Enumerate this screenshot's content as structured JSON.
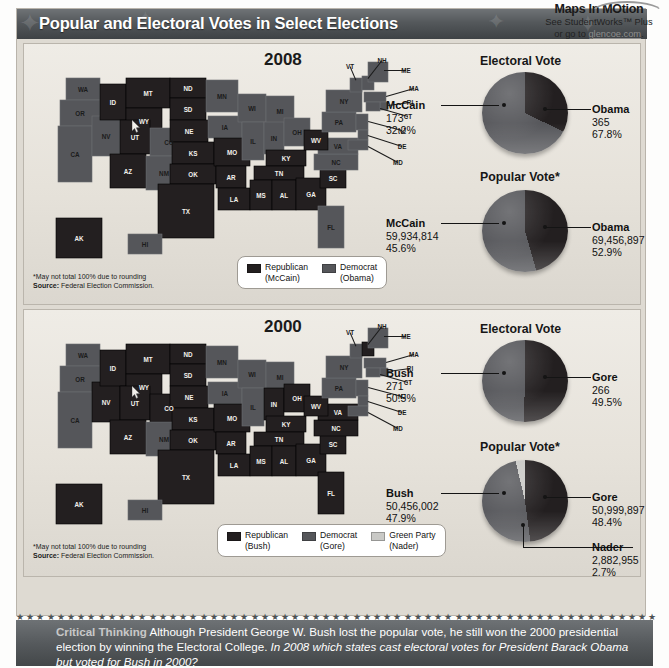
{
  "maps_in_motion": {
    "title": "Maps In MOtion",
    "line1": "See StudentWorks™ Plus",
    "line2_pre": "or go to ",
    "line2_link": "glencoe.com",
    "line2_post": "."
  },
  "banner": {
    "title": "Popular and Electoral Votes in Select Elections"
  },
  "colors": {
    "republican": "#231f20",
    "democrat": "#55565a",
    "green_party": "#c9c9c6",
    "banner": "#54585b",
    "panel_bg": "#e6e2da"
  },
  "sections": [
    {
      "year": "2008",
      "map": {
        "state_labels": [
          "WA",
          "OR",
          "CA",
          "NV",
          "ID",
          "MT",
          "WY",
          "UT",
          "CO",
          "AZ",
          "NM",
          "ND",
          "SD",
          "NE",
          "KS",
          "OK",
          "TX",
          "MN",
          "IA",
          "MO",
          "AR",
          "LA",
          "WI",
          "IL",
          "MI",
          "IN",
          "OH",
          "KY",
          "TN",
          "MS",
          "AL",
          "GA",
          "FL",
          "SC",
          "NC",
          "VA",
          "WV",
          "PA",
          "NY",
          "VT",
          "NH",
          "ME",
          "MA",
          "RI",
          "CT",
          "NJ",
          "DE",
          "MD",
          "AK",
          "HI"
        ],
        "democrat_states": [
          "WA",
          "OR",
          "CA",
          "NV",
          "CO",
          "NM",
          "MN",
          "IA",
          "WI",
          "IL",
          "MI",
          "IN",
          "OH",
          "PA",
          "NY",
          "VT",
          "NH",
          "ME",
          "MA",
          "RI",
          "CT",
          "NJ",
          "DE",
          "MD",
          "VA",
          "NC",
          "FL",
          "HI"
        ],
        "republican_states": [
          "ID",
          "MT",
          "WY",
          "UT",
          "AZ",
          "ND",
          "SD",
          "NE",
          "KS",
          "OK",
          "TX",
          "MO",
          "AR",
          "LA",
          "KY",
          "TN",
          "MS",
          "AL",
          "GA",
          "SC",
          "WV",
          "AK"
        ]
      },
      "legend": [
        {
          "label": "Republican",
          "sub": "(McCain)",
          "color": "#231f20"
        },
        {
          "label": "Democrat",
          "sub": "(Obama)",
          "color": "#55565a"
        }
      ],
      "footnote_star": "*May not total 100% due to rounding",
      "footnote_source_label": "Source:",
      "footnote_source_value": " Federal Election Commission.",
      "charts": [
        {
          "title": "Electoral Vote",
          "title_star": false,
          "slices": [
            {
              "name": "McCain",
              "value": "173",
              "percent": "32.2%",
              "pct": 32.2,
              "color": "#231f20",
              "side": "left"
            },
            {
              "name": "Obama",
              "value": "365",
              "percent": "67.8%",
              "pct": 67.8,
              "color": "#55565a",
              "side": "right"
            }
          ]
        },
        {
          "title": "Popular Vote",
          "title_star": true,
          "slices": [
            {
              "name": "McCain",
              "value": "59,934,814",
              "percent": "45.6%",
              "pct": 45.6,
              "color": "#231f20",
              "side": "left"
            },
            {
              "name": "Obama",
              "value": "69,456,897",
              "percent": "52.9%",
              "pct": 52.9,
              "color": "#55565a",
              "side": "right"
            }
          ]
        }
      ]
    },
    {
      "year": "2000",
      "map": {
        "state_labels": [
          "WA",
          "OR",
          "CA",
          "NV",
          "ID",
          "MT",
          "WY",
          "UT",
          "CO",
          "AZ",
          "NM",
          "ND",
          "SD",
          "NE",
          "KS",
          "OK",
          "TX",
          "MN",
          "IA",
          "MO",
          "AR",
          "LA",
          "WI",
          "IL",
          "MI",
          "IN",
          "OH",
          "KY",
          "TN",
          "MS",
          "AL",
          "GA",
          "FL",
          "SC",
          "NC",
          "VA",
          "WV",
          "PA",
          "NY",
          "VT",
          "NH",
          "ME",
          "MA",
          "RI",
          "CT",
          "NJ",
          "DE",
          "MD",
          "AK",
          "HI"
        ],
        "democrat_states": [
          "WA",
          "OR",
          "CA",
          "NM",
          "MN",
          "IA",
          "WI",
          "IL",
          "MI",
          "PA",
          "NY",
          "VT",
          "ME",
          "MA",
          "RI",
          "CT",
          "NJ",
          "DE",
          "MD",
          "HI"
        ],
        "republican_states": [
          "NV",
          "ID",
          "MT",
          "WY",
          "UT",
          "CO",
          "AZ",
          "ND",
          "SD",
          "NE",
          "KS",
          "OK",
          "TX",
          "MO",
          "AR",
          "LA",
          "IN",
          "OH",
          "KY",
          "TN",
          "MS",
          "AL",
          "GA",
          "SC",
          "NC",
          "VA",
          "WV",
          "FL",
          "NH",
          "AK"
        ]
      },
      "legend": [
        {
          "label": "Republican",
          "sub": "(Bush)",
          "color": "#231f20"
        },
        {
          "label": "Democrat",
          "sub": "(Gore)",
          "color": "#55565a"
        },
        {
          "label": "Green Party",
          "sub": "(Nader)",
          "color": "#c9c9c6"
        }
      ],
      "footnote_star": "*May not total 100% due to rounding",
      "footnote_source_label": "Source:",
      "footnote_source_value": " Federal Election Commission.",
      "charts": [
        {
          "title": "Electoral Vote",
          "title_star": false,
          "slices": [
            {
              "name": "Bush",
              "value": "271",
              "percent": "50.5%",
              "pct": 50.5,
              "color": "#231f20",
              "side": "left"
            },
            {
              "name": "Gore",
              "value": "266",
              "percent": "49.5%",
              "pct": 49.5,
              "color": "#55565a",
              "side": "right"
            }
          ]
        },
        {
          "title": "Popular Vote",
          "title_star": true,
          "slices": [
            {
              "name": "Bush",
              "value": "50,456,002",
              "percent": "47.9%",
              "pct": 47.9,
              "color": "#231f20",
              "side": "left"
            },
            {
              "name": "Gore",
              "value": "50,999,897",
              "percent": "48.4%",
              "pct": 48.4,
              "color": "#55565a",
              "side": "right"
            },
            {
              "name": "Nader",
              "value": "2,882,955",
              "percent": "2.7%",
              "pct": 2.7,
              "color": "#c9c9c6",
              "side": "bottom"
            }
          ]
        }
      ]
    }
  ],
  "critical_thinking": {
    "lead": "Critical Thinking",
    "body": " Although President George W. Bush lost the popular vote, he still won the 2000 presidential election by winning the Electoral College. ",
    "question": "In 2008 which states cast electoral votes for President Barack Obama but voted for Bush in 2000?"
  },
  "chart_data": [
    {
      "type": "pie",
      "title": "Electoral Vote",
      "election": "2008",
      "categories": [
        "McCain",
        "Obama"
      ],
      "values": [
        173,
        365
      ],
      "percents": [
        32.2,
        67.8
      ],
      "colors": [
        "#231f20",
        "#55565a"
      ],
      "legend": "callout labels"
    },
    {
      "type": "pie",
      "title": "Popular Vote*",
      "election": "2008",
      "categories": [
        "McCain",
        "Obama"
      ],
      "values": [
        59934814,
        69456897
      ],
      "percents": [
        45.6,
        52.9
      ],
      "colors": [
        "#231f20",
        "#55565a"
      ],
      "note": "*May not total 100% due to rounding"
    },
    {
      "type": "pie",
      "title": "Electoral Vote",
      "election": "2000",
      "categories": [
        "Bush",
        "Gore"
      ],
      "values": [
        271,
        266
      ],
      "percents": [
        50.5,
        49.5
      ],
      "colors": [
        "#231f20",
        "#55565a"
      ]
    },
    {
      "type": "pie",
      "title": "Popular Vote*",
      "election": "2000",
      "categories": [
        "Bush",
        "Gore",
        "Nader"
      ],
      "values": [
        50456002,
        50999897,
        2882955
      ],
      "percents": [
        47.9,
        48.4,
        2.7
      ],
      "colors": [
        "#231f20",
        "#55565a",
        "#c9c9c6"
      ],
      "note": "*May not total 100% due to rounding"
    }
  ]
}
